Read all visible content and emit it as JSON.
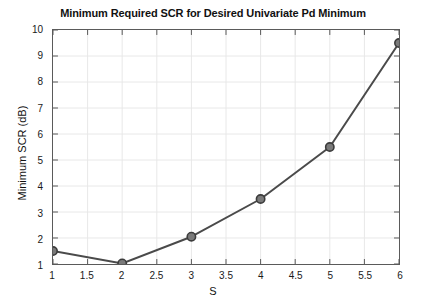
{
  "chart_data": {
    "type": "line",
    "title": "Minimum Required SCR for Desired Univariate Pd Minimum",
    "xlabel": "S",
    "ylabel": "Minimum SCR (dB)",
    "x": [
      1,
      2,
      3,
      4,
      5,
      6
    ],
    "values": [
      1.5,
      1.02,
      2.05,
      3.5,
      5.5,
      9.5
    ],
    "series": [
      {
        "name": "Minimum Required SCR",
        "x": [
          1,
          2,
          3,
          4,
          5,
          6
        ],
        "values": [
          1.5,
          1.02,
          2.05,
          3.5,
          5.5,
          9.5
        ]
      }
    ],
    "xlim": [
      1,
      6
    ],
    "ylim": [
      1,
      10
    ],
    "xticks": [
      1,
      1.5,
      2,
      2.5,
      3,
      3.5,
      4,
      4.5,
      5,
      5.5,
      6
    ],
    "xtick_labels": [
      "1",
      "1.5",
      "2",
      "2.5",
      "3",
      "3.5",
      "4",
      "4.5",
      "5",
      "5.5",
      "6"
    ],
    "yticks": [
      1,
      2,
      3,
      4,
      5,
      6,
      7,
      8,
      9,
      10
    ],
    "ytick_labels": [
      "1",
      "2",
      "3",
      "4",
      "5",
      "6",
      "7",
      "8",
      "9",
      "10"
    ],
    "grid": true,
    "legend": null,
    "line_color": "#4a4a4a",
    "marker": "circle",
    "marker_face_color": "#7a7a7a",
    "marker_edge_color": "#3c3c3c",
    "grid_color": "#e8e8e8",
    "axes_color": "#5a5a5a",
    "background_color": "#ffffff"
  }
}
